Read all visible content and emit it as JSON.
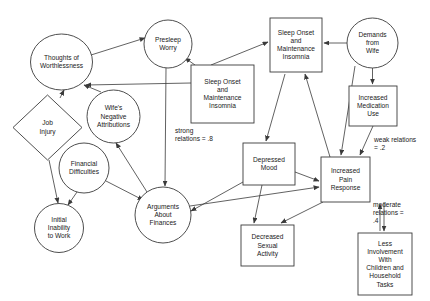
{
  "diagram": {
    "background_color": "#ffffff",
    "stroke_color": "#3a3a3a",
    "text_color": "#1a1a1a",
    "nodes": [
      {
        "id": "thoughts_worthlessness",
        "label": "Thoughts of\nWorthlessness",
        "shape": "ellipse",
        "cx": 61.5,
        "cy": 62,
        "rx": 31,
        "ry": 28
      },
      {
        "id": "presleep_worry",
        "label": "Presleep\nWorry",
        "shape": "ellipse",
        "cx": 168,
        "cy": 44,
        "rx": 24,
        "ry": 24
      },
      {
        "id": "sleep_onset_insomnia_top",
        "label": "Sleep Onset\nand\nMaintenance\nInsomnia",
        "shape": "rect",
        "x": 270,
        "y": 18,
        "w": 52,
        "h": 54
      },
      {
        "id": "demands_from_wife",
        "label": "Demands\nfrom\nWife",
        "shape": "ellipse",
        "cx": 372.5,
        "cy": 43,
        "rx": 25.5,
        "ry": 25
      },
      {
        "id": "sleep_onset_insomnia_left",
        "label": "Sleep Onset\nand\nMaintenance\nInsomnia",
        "shape": "rect",
        "x": 191,
        "y": 65,
        "w": 63,
        "h": 58
      },
      {
        "id": "increased_medication_use",
        "label": "Increased\nMedication\nUse",
        "shape": "rect",
        "x": 349,
        "y": 86,
        "w": 48,
        "h": 40
      },
      {
        "id": "job_injury",
        "label": "Job\nInjury",
        "shape": "diamond",
        "cx": 47.5,
        "cy": 127.5,
        "rx": 34.5,
        "ry": 32.5
      },
      {
        "id": "wifes_negative_attributions",
        "label": "Wife's\nNegative\nAttributions",
        "shape": "ellipse",
        "cx": 113.5,
        "cy": 116.5,
        "rx": 26.5,
        "ry": 26.5
      },
      {
        "id": "financial_difficulties",
        "label": "Financial\nDifficulties",
        "shape": "ellipse",
        "cx": 84,
        "cy": 168,
        "rx": 25,
        "ry": 25
      },
      {
        "id": "depressed_mood",
        "label": "Depressed\nMood",
        "shape": "rect",
        "x": 243,
        "y": 143,
        "w": 52,
        "h": 42
      },
      {
        "id": "increased_pain_response",
        "label": "Increased\nPain\nResponse",
        "shape": "rect",
        "x": 321,
        "y": 157,
        "w": 49,
        "h": 45
      },
      {
        "id": "initial_inability_to_work",
        "label": "Initial\nInability\nto Work",
        "shape": "ellipse",
        "cx": 59,
        "cy": 228,
        "rx": 24.5,
        "ry": 24.5
      },
      {
        "id": "arguments_about_finances",
        "label": "Arguments\nAbout\nFinances",
        "shape": "ellipse",
        "cx": 163,
        "cy": 215,
        "rx": 28,
        "ry": 28
      },
      {
        "id": "decreased_sexual_activity",
        "label": "Decreased\nSexual\nActivity",
        "shape": "rect",
        "x": 241,
        "y": 225,
        "w": 53,
        "h": 41
      },
      {
        "id": "less_involvement",
        "label": "Less\nInvolvement\nWith\nChildren and\nHousehold\nTasks",
        "shape": "rect",
        "x": 358,
        "y": 233,
        "w": 54,
        "h": 62
      }
    ],
    "edges": [
      {
        "id": "e1",
        "from": "thoughts_worthlessness",
        "to": "presleep_worry",
        "x1": 91,
        "y1": 55,
        "x2": 145,
        "y2": 38
      },
      {
        "id": "e2",
        "from": "sleep_onset_insomnia_left",
        "to": "thoughts_worthlessness",
        "x1": 191,
        "y1": 83,
        "x2": 86,
        "y2": 85
      },
      {
        "id": "e3",
        "from": "sleep_onset_insomnia_left",
        "to": "presleep_worry",
        "x1": 195,
        "y1": 65,
        "x2": 185,
        "y2": 58
      },
      {
        "id": "e4",
        "from": "sleep_onset_insomnia_left",
        "to": "sleep_onset_insomnia_top",
        "x1": 211,
        "y1": 65,
        "x2": 268,
        "y2": 42
      },
      {
        "id": "e5",
        "from": "demands_from_wife",
        "to": "sleep_onset_insomnia_top",
        "x1": 347,
        "y1": 43,
        "x2": 324,
        "y2": 43
      },
      {
        "id": "e6",
        "from": "demands_from_wife",
        "to": "increased_medication_use",
        "x1": 372.5,
        "y1": 68,
        "x2": 372.5,
        "y2": 84
      },
      {
        "id": "e7",
        "from": "increased_medication_use",
        "to": "increased_pain_response",
        "x1": 373,
        "y1": 126,
        "x2": 360,
        "y2": 155
      },
      {
        "id": "e8",
        "from": "demands_from_wife",
        "to": "increased_pain_response",
        "x1": 355,
        "y1": 66,
        "x2": 341,
        "y2": 155
      },
      {
        "id": "e9",
        "from": "job_injury",
        "to": "thoughts_worthlessness",
        "x1": 60,
        "y1": 98,
        "x2": 64,
        "y2": 90
      },
      {
        "id": "e10",
        "from": "job_injury",
        "to": "initial_inability_to_work",
        "x1": 49,
        "y1": 160,
        "x2": 58,
        "y2": 203
      },
      {
        "id": "e11",
        "from": "wifes_negative_attributions",
        "to": "thoughts_worthlessness",
        "x1": 101,
        "y1": 92,
        "x2": 84,
        "y2": 85
      },
      {
        "id": "e12",
        "from": "arguments_about_finances",
        "to": "wifes_negative_attributions",
        "x1": 147,
        "y1": 192,
        "x2": 116,
        "y2": 143
      },
      {
        "id": "e13",
        "from": "financial_difficulties",
        "to": "initial_inability_to_work",
        "x1": 77,
        "y1": 192,
        "x2": 68,
        "y2": 205
      },
      {
        "id": "e14",
        "from": "financial_difficulties",
        "to": "arguments_about_finances",
        "x1": 106,
        "y1": 181,
        "x2": 143,
        "y2": 200
      },
      {
        "id": "e15",
        "from": "presleep_worry",
        "to": "arguments_about_finances",
        "x1": 166,
        "y1": 68,
        "x2": 165,
        "y2": 186
      },
      {
        "id": "e16",
        "from": "sleep_onset_insomnia_top",
        "to": "depressed_mood",
        "x1": 285,
        "y1": 74,
        "x2": 266,
        "y2": 141
      },
      {
        "id": "e17",
        "from": "increased_pain_response",
        "to": "sleep_onset_insomnia_top",
        "x1": 330,
        "y1": 157,
        "x2": 305,
        "y2": 74
      },
      {
        "id": "e18",
        "from": "depressed_mood",
        "to": "increased_pain_response",
        "x1": 295,
        "y1": 172,
        "x2": 319,
        "y2": 181
      },
      {
        "id": "e19",
        "from": "arguments_about_finances",
        "to": "increased_pain_response",
        "x1": 190,
        "y1": 206,
        "x2": 319,
        "y2": 187
      },
      {
        "id": "e20",
        "from": "depressed_mood",
        "to": "arguments_about_finances",
        "x1": 243,
        "y1": 182,
        "x2": 191,
        "y2": 211
      },
      {
        "id": "e21",
        "from": "depressed_mood",
        "to": "decreased_sexual_activity",
        "x1": 262,
        "y1": 185,
        "x2": 254,
        "y2": 223
      },
      {
        "id": "e22",
        "from": "increased_pain_response",
        "to": "decreased_sexual_activity",
        "x1": 323,
        "y1": 202,
        "x2": 281,
        "y2": 223
      },
      {
        "id": "e23",
        "from": "increased_pain_response",
        "to": "less_involvement",
        "x1": 384,
        "y1": 202,
        "x2": 384,
        "y2": 231
      },
      {
        "id": "e24",
        "from": "less_involvement",
        "to": "increased_pain_response",
        "x1": 380,
        "y1": 231,
        "x2": 380,
        "y2": 204
      }
    ],
    "annotations": [
      {
        "id": "strong_relations",
        "lines": [
          "strong",
          "relations = .8"
        ],
        "x": 175,
        "y": 131
      },
      {
        "id": "weak_relations",
        "lines": [
          "weak relations",
          "= .2"
        ],
        "x": 374,
        "y": 140
      },
      {
        "id": "moderate_relations",
        "lines": [
          "moderate",
          "relations =",
          ".4"
        ],
        "x": 373,
        "y": 205
      }
    ]
  }
}
